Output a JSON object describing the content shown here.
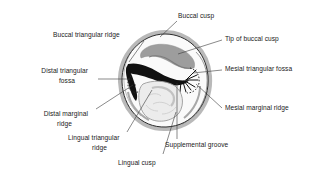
{
  "figure": {
    "width": 327,
    "height": 179,
    "background_color": "#ffffff"
  },
  "colors": {
    "outline": "#2b2b2b",
    "enamel_rim": "#b8b8b8",
    "crown_fill": "#f2f2f2",
    "buccal_ridge_gray": "#9a9a9a",
    "groove_black": "#111111",
    "lingual_cusp_fill": "#ebebeb",
    "leader_line": "#3a3a3a",
    "text": "#1a1a1a"
  },
  "labels": [
    {
      "id": "buccal-cusp",
      "text": "Buccal cusp",
      "x": 178,
      "y": 16,
      "anchor": "start",
      "leader": "M 176 18 L 160 33"
    },
    {
      "id": "tip-of-buccal-cusp",
      "text": "Tip of buccal cusp",
      "x": 225,
      "y": 41,
      "anchor": "start",
      "leader": "M 223 39 L 176 53"
    },
    {
      "id": "mesial-triangular-fossa",
      "text": "Mesial triangular fossa",
      "x": 225,
      "y": 70,
      "anchor": "start",
      "leader": "M 223 68 L 193 72"
    },
    {
      "id": "mesial-marginal-ridge",
      "text": "Mesial marginal ridge",
      "x": 225,
      "y": 110,
      "anchor": "start",
      "leader": "M 223 107 L 198 84"
    },
    {
      "id": "buccal-triangular-ridge",
      "text": "Buccal triangular ridge",
      "x": 53,
      "y": 36,
      "anchor": "start",
      "leader": "M 143 35 L 128 61"
    },
    {
      "id": "distal-triangular-fossa",
      "text": "Distal triangular fossa",
      "x": 26,
      "y": 73,
      "anchor": "start",
      "lines": [
        "Distal triangular",
        "fossa"
      ],
      "leader": "M 93 80 L 130 80"
    },
    {
      "id": "distal-marginal-ridge",
      "text": "Distal marginal ridge",
      "x": 12,
      "y": 115,
      "anchor": "start",
      "lines": [
        "Distal marginal",
        "ridge"
      ],
      "leader": "M 94 110 L 132 86"
    },
    {
      "id": "lingual-triangular-ridge",
      "text": "Lingual triangular ridge",
      "x": 68,
      "y": 140,
      "anchor": "start",
      "lines": [
        "Lingual triangular",
        "ridge"
      ],
      "leader": "M 128 133 L 151 90"
    },
    {
      "id": "lingual-cusp",
      "text": "Lingual cusp",
      "x": 118,
      "y": 163,
      "anchor": "start",
      "leader": "M 162 155 L 175 112"
    },
    {
      "id": "supplemental-groove",
      "text": "Supplemental groove",
      "x": 165,
      "y": 146,
      "anchor": "start",
      "leader": "M 177 140 L 177 84"
    }
  ],
  "label_lines": {
    "distal_triangular_fossa": [
      "Distal triangular",
      "fossa"
    ],
    "distal_marginal_ridge": [
      "Distal marginal",
      "ridge"
    ],
    "lingual_triangular_ridge": [
      "Lingual triangular",
      "ridge"
    ]
  }
}
